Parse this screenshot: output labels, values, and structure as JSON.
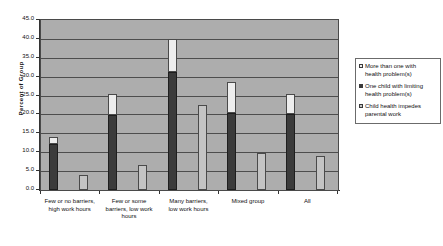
{
  "chart_data": {
    "type": "bar",
    "title": "",
    "subtitle": "",
    "xlabel": "",
    "ylabel": "Percent of Group",
    "ylim": [
      0.0,
      45.0
    ],
    "ytick_step": 5.0,
    "ytick_labels": [
      "45.0",
      "40.0",
      "35.0",
      "30.0",
      "25.0",
      "20.0",
      "15.0",
      "10.0",
      "5.0",
      "0.0"
    ],
    "grid": true,
    "grid_axis": "y",
    "legend_position": "right",
    "stacked": true,
    "categories": [
      "Few or no barriers, high work hours",
      "Few or some barriers, low work hours",
      "Many barriers, low work hours",
      "Mixed group",
      "All"
    ],
    "series": [
      {
        "name": "One child with limiting health problem(s)",
        "color": "#3b3b3b",
        "values": [
          12.3,
          19.8,
          31.3,
          20.3,
          20.0
        ]
      },
      {
        "name": "More than one with health problem(s)",
        "color": "#ededed",
        "values": [
          1.7,
          5.7,
          8.7,
          8.4,
          5.5
        ]
      },
      {
        "name": "Child health impedes parental work",
        "color": "#c4c4c4",
        "values": [
          4.0,
          6.5,
          22.5,
          9.8,
          9.0
        ]
      }
    ],
    "stack_totals": [
      14.0,
      25.5,
      40.0,
      28.7,
      25.5
    ]
  },
  "legend": {
    "entries": [
      {
        "label_line1": "More than one with",
        "label_line2": "health problem(s)",
        "swatch": "light-swatch"
      },
      {
        "label_line1": "One child with limiting",
        "label_line2": "health problem(s)",
        "swatch": "dark-swatch"
      },
      {
        "label_line1": "Child health impedes",
        "label_line2": "parental work",
        "swatch": "gray-swatch"
      }
    ]
  },
  "axes": {
    "y_title": "Percent of Group",
    "x_labels": [
      {
        "line1": "Few or no barriers,",
        "line2": "high work hours",
        "line3": ""
      },
      {
        "line1": "Few or some",
        "line2": "barriers, low work",
        "line3": "hours"
      },
      {
        "line1": "Many barriers,",
        "line2": "low work hours",
        "line3": ""
      },
      {
        "line1": "Mixed group",
        "line2": "",
        "line3": ""
      },
      {
        "line1": "All",
        "line2": "",
        "line3": ""
      }
    ]
  },
  "colors": {
    "plot_background": "#adadad",
    "gridline": "#4d4d4d",
    "axis": "#333333",
    "dark_series": "#3b3b3b",
    "light_series": "#ededed",
    "gray_series": "#c4c4c4",
    "page_background": "#ffffff"
  }
}
